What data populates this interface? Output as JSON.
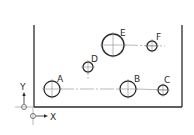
{
  "diagram": {
    "type": "hole-pattern-drawing",
    "colors": {
      "line": "#2a2a2a",
      "centerline": "#8a8a8a",
      "background": "#ffffff"
    },
    "plate": {
      "left": 34,
      "right": 182,
      "top": 25,
      "bottom": 107
    },
    "axes": {
      "x_label": "X",
      "y_label": "Y"
    },
    "holes": [
      {
        "id": "A",
        "label": "A",
        "cx": 52,
        "cy": 89,
        "r": 8
      },
      {
        "id": "B",
        "label": "B",
        "cx": 128,
        "cy": 89,
        "r": 8
      },
      {
        "id": "C",
        "label": "C",
        "cx": 163,
        "cy": 90,
        "r": 5
      },
      {
        "id": "D",
        "label": "D",
        "cx": 88,
        "cy": 67,
        "r": 5
      },
      {
        "id": "E",
        "label": "E",
        "cx": 113,
        "cy": 45,
        "r": 11
      },
      {
        "id": "F",
        "label": "F",
        "cx": 152,
        "cy": 46,
        "r": 5
      }
    ]
  }
}
